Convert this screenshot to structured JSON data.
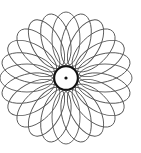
{
  "figure": {
    "type": "spirograph",
    "center": [
      66,
      78
    ],
    "ellipse_count": 24,
    "ellipse_center_offset": 39,
    "ellipse_rx": 27,
    "ellipse_ry": 14,
    "inner_circle_radius": 11,
    "center_dot_radius": 1.6,
    "stroke_color": "#555555",
    "ring_color": "#111111",
    "background": "#ffffff"
  }
}
